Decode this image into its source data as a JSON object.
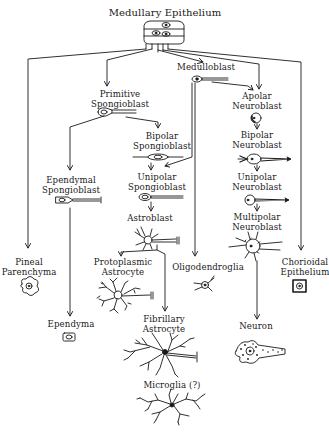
{
  "diagram": {
    "title": "Medullary Epithelium",
    "colors": {
      "ink": "#1a1a1a",
      "background": "#ffffff"
    },
    "nodes": [
      {
        "id": "medullary_epithelium",
        "label": "Medullary Epithelium",
        "x": 165,
        "y": 7
      },
      {
        "id": "medulloblast",
        "label": "Medulloblast",
        "x": 206,
        "y": 63
      },
      {
        "id": "primitive_spongioblast",
        "label": "Primitive\nSpongioblast",
        "x": 120,
        "y": 90
      },
      {
        "id": "apolar_neuroblast",
        "label": "Apolar\nNeuroblast",
        "x": 257,
        "y": 92
      },
      {
        "id": "bipolar_spongioblast",
        "label": "Bipolar\nSpongioblast",
        "x": 162,
        "y": 132
      },
      {
        "id": "bipolar_neuroblast",
        "label": "Bipolar\nNeuroblast",
        "x": 257,
        "y": 131
      },
      {
        "id": "ependymal_spongioblast",
        "label": "Ependymal\nSpongioblast",
        "x": 71,
        "y": 176
      },
      {
        "id": "unipolar_spongioblast",
        "label": "Unipolar\nSpongioblast",
        "x": 157,
        "y": 173
      },
      {
        "id": "unipolar_neuroblast",
        "label": "Unipolar\nNeuroblast",
        "x": 257,
        "y": 173
      },
      {
        "id": "astroblast",
        "label": "Astroblast",
        "x": 150,
        "y": 214
      },
      {
        "id": "multipolar_neuroblast",
        "label": "Multipolar\nNeuroblast",
        "x": 257,
        "y": 213
      },
      {
        "id": "pineal_parenchyma",
        "label": "Pineal\nParenchyma",
        "x": 29,
        "y": 258
      },
      {
        "id": "protoplasmic_astrocyte",
        "label": "Protoplasmic\nAstrocyte",
        "x": 123,
        "y": 258
      },
      {
        "id": "oligodendroglia",
        "label": "Oligodendroglia",
        "x": 208,
        "y": 263
      },
      {
        "id": "chorioidal_epithelium",
        "label": "Chorioidal\nEpithelium",
        "x": 305,
        "y": 258
      },
      {
        "id": "fibrillary_astrocyte",
        "label": "Fibrillary\nAstrocyte",
        "x": 164,
        "y": 315
      },
      {
        "id": "ependyma",
        "label": "Ependyma",
        "x": 71,
        "y": 320
      },
      {
        "id": "neuron",
        "label": "Neuron",
        "x": 256,
        "y": 322
      },
      {
        "id": "microglia",
        "label": "Microglia (?)",
        "x": 172,
        "y": 381
      }
    ],
    "edges": [
      [
        "medullary_epithelium",
        "pineal_parenchyma"
      ],
      [
        "medullary_epithelium",
        "primitive_spongioblast"
      ],
      [
        "medullary_epithelium",
        "medulloblast"
      ],
      [
        "medullary_epithelium",
        "apolar_neuroblast"
      ],
      [
        "medullary_epithelium",
        "chorioidal_epithelium"
      ],
      [
        "primitive_spongioblast",
        "ependymal_spongioblast"
      ],
      [
        "primitive_spongioblast",
        "bipolar_spongioblast"
      ],
      [
        "bipolar_spongioblast",
        "unipolar_spongioblast"
      ],
      [
        "medulloblast",
        "unipolar_spongioblast"
      ],
      [
        "medulloblast",
        "oligodendroglia"
      ],
      [
        "medulloblast",
        "apolar_neuroblast"
      ],
      [
        "apolar_neuroblast",
        "bipolar_neuroblast"
      ],
      [
        "bipolar_neuroblast",
        "unipolar_neuroblast"
      ],
      [
        "unipolar_neuroblast",
        "multipolar_neuroblast"
      ],
      [
        "multipolar_neuroblast",
        "neuron"
      ],
      [
        "unipolar_spongioblast",
        "astroblast"
      ],
      [
        "astroblast",
        "protoplasmic_astrocyte"
      ],
      [
        "astroblast",
        "fibrillary_astrocyte"
      ],
      [
        "ependymal_spongioblast",
        "ependyma"
      ]
    ]
  }
}
